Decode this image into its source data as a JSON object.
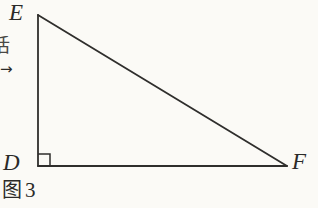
{
  "figure": {
    "caption_char": "图",
    "caption_number": "3",
    "background_color": "#fbfaf6",
    "stroke_color": "#2f2e2c",
    "labels": {
      "apex": "E",
      "right_angle_vertex": "D",
      "right_vertex": "F"
    },
    "margin": {
      "clipped_character": "话",
      "arrow_glyph": "→"
    },
    "geometry": {
      "vertices": {
        "E": {
          "x": 38,
          "y": 15
        },
        "D": {
          "x": 38,
          "y": 166
        },
        "F": {
          "x": 287,
          "y": 166
        }
      },
      "right_angle_marker": {
        "vertex": "D",
        "size": 12
      },
      "segments": [
        {
          "name": "DE",
          "from": "D",
          "to": "E",
          "type": "leg"
        },
        {
          "name": "DF",
          "from": "D",
          "to": "F",
          "type": "leg"
        },
        {
          "name": "EF",
          "from": "E",
          "to": "F",
          "type": "hypotenuse"
        }
      ],
      "stroke_width": 1.8
    }
  }
}
